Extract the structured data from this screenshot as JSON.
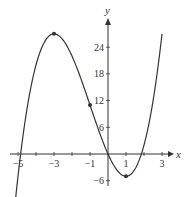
{
  "chart_data": {
    "type": "line",
    "title": "",
    "function": "f(x) = x^3 + 3x^2 - 9x",
    "xlabel": "x",
    "ylabel": "y",
    "xlim": [
      -5.5,
      3.5
    ],
    "ylim": [
      -8,
      30
    ],
    "grid": false,
    "x_ticks": [
      -5,
      -4,
      -3,
      -2,
      -1,
      1,
      2,
      3
    ],
    "x_tick_labels": [
      "-5",
      "-3",
      "-1",
      "1",
      "3"
    ],
    "x_tick_label_values": [
      -5,
      -3,
      -1,
      1,
      3
    ],
    "y_ticks": [
      -6,
      6,
      12,
      18,
      24
    ],
    "y_tick_labels": [
      "-6",
      "6",
      "12",
      "18",
      "24"
    ],
    "series": [
      {
        "name": "curve",
        "x": [
          -5.3,
          -5,
          -4.5,
          -4,
          -3.5,
          -3,
          -2.5,
          -2,
          -1.5,
          -1,
          -0.5,
          0,
          0.5,
          1,
          1.5,
          2,
          2.5,
          3
        ],
        "values": [
          -19.8,
          -5,
          8.9,
          20,
          25.4,
          27,
          25.6,
          22,
          17.6,
          11,
          5.4,
          0,
          -3.6,
          -5,
          -3.4,
          2,
          10.6,
          27
        ]
      }
    ],
    "marked_points": [
      {
        "x": -3,
        "y": 27,
        "label": "local maximum"
      },
      {
        "x": -1,
        "y": 11,
        "label": "inflection point"
      },
      {
        "x": 1,
        "y": -5,
        "label": "local minimum"
      }
    ]
  }
}
